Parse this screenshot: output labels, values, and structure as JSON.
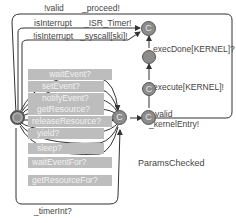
{
  "diagram": {
    "type": "timed-automaton",
    "top_edge": {
      "guard": "!valid",
      "sync": "_proceed!"
    },
    "interrupt_edges": [
      {
        "guard": "isInterrupt",
        "sync": "_ISR_Timer!"
      },
      {
        "guard": "!isInterrupt",
        "sync": "_syscall[ski]!"
      }
    ],
    "syscalls": [
      "waitEvent?",
      "setEvent?",
      "notifyEvent?",
      "getResource?",
      "releaseResource?",
      "yield?",
      "sleep?",
      "waitEventFor?",
      "getResourceFor?"
    ],
    "timer_edge": "_timerInt?",
    "kernel_edges": {
      "exec_done": "execDone[KERNEL]?",
      "execute": "execute[KERNEL]!",
      "valid_guard": "valid",
      "kernel_entry": "_kernelEntry!"
    },
    "location_label": "ParamsChecked",
    "committed_symbol": "C",
    "colors": {
      "node": "#8c8c8c",
      "highlight": "#bdbdbd",
      "edge": "#333333"
    }
  }
}
